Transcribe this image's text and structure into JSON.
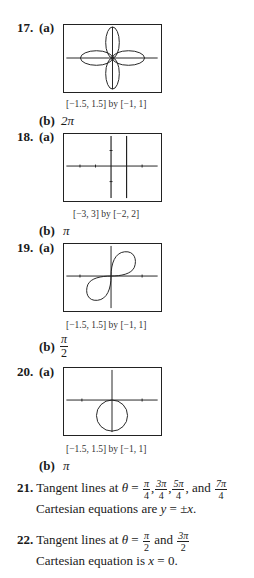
{
  "problems": [
    {
      "number": "17.",
      "part_a": "(a)",
      "window": "[−1.5, 1.5] by [−1, 1]",
      "part_b": "(b)",
      "answer_b": "2π",
      "graph": "four-petal-rose"
    },
    {
      "number": "18.",
      "part_a": "(a)",
      "window": "[−3, 3] by [−2, 2]",
      "part_b": "(b)",
      "answer_b": "π",
      "graph": "vertical-line"
    },
    {
      "number": "19.",
      "part_a": "(a)",
      "window": "[−1.5, 1.5] by [−1, 1]",
      "part_b": "(b)",
      "answer_b_num": "π",
      "answer_b_den": "2",
      "graph": "lemniscate-two-loop"
    },
    {
      "number": "20.",
      "part_a": "(a)",
      "window": "[−1.5, 1.5] by [−1, 1]",
      "part_b": "(b)",
      "answer_b": "π",
      "graph": "circle-below"
    }
  ],
  "p21": {
    "number": "21.",
    "text1": "Tangent lines at ",
    "theta": "θ",
    "eq": " = ",
    "f1n": "π",
    "f1d": "4",
    "f2n": "3π",
    "f2d": "4",
    "f3n": "5π",
    "f3d": "4",
    "and": ", and ",
    "f4n": "7π",
    "f4d": "4",
    "comma": ",",
    "line2a": "Cartesian equations are ",
    "line2b": "y",
    "line2c": " = ±",
    "line2d": "x",
    "line2e": "."
  },
  "p22": {
    "number": "22.",
    "text1": "Tangent lines at ",
    "theta": "θ",
    "eq": " = ",
    "f1n": "π",
    "f1d": "2",
    "and": " and ",
    "f2n": "3π",
    "f2d": "2",
    "line2a": "Cartesian equation is ",
    "line2b": "x",
    "line2c": " = 0."
  }
}
